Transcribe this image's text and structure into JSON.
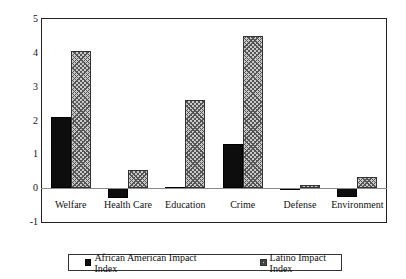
{
  "chart_data": {
    "type": "bar",
    "title": "",
    "xlabel": "",
    "ylabel": "Impact Index",
    "ylim": [
      -1,
      5
    ],
    "yticks": [
      5,
      4,
      3,
      2,
      1,
      0,
      -1
    ],
    "grid": false,
    "legend_position": "bottom",
    "categories": [
      "Welfare",
      "Health Care",
      "Education",
      "Crime",
      "Defense",
      "Environment"
    ],
    "series": [
      {
        "name": "African American Impact Index",
        "swatch": "solid-black",
        "color": "#0d0d0d",
        "values": [
          2.1,
          -0.28,
          0.03,
          1.3,
          -0.05,
          -0.25
        ]
      },
      {
        "name": "Latino Impact Index",
        "swatch": "hatched-gray",
        "color": "#c9c9c9",
        "values": [
          4.05,
          0.53,
          2.6,
          4.5,
          0.1,
          0.33
        ]
      }
    ]
  }
}
